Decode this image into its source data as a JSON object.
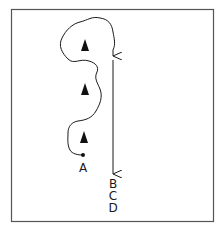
{
  "diagram": {
    "stroke_color": "#1a1a1a",
    "frame_color": "#555555",
    "markers": [
      {
        "name": "cone-1",
        "shape": "triangle"
      },
      {
        "name": "cone-2",
        "shape": "triangle"
      },
      {
        "name": "cone-3",
        "shape": "triangle"
      }
    ],
    "start_point": {
      "label": "A"
    },
    "end_labels": [
      "B",
      "C",
      "D"
    ]
  }
}
